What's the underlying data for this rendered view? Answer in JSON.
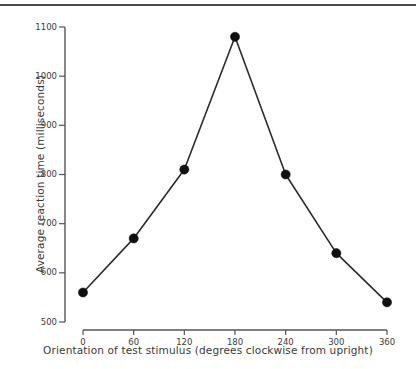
{
  "figure": {
    "kind": "line-plot",
    "background_color": "#ffffff",
    "top_rule_color": "#4a4a4a",
    "line_color": "#2b2b2b",
    "marker_color": "#101010",
    "axis_color": "#555555",
    "text_color": "#3a3a3a"
  },
  "chart_data": {
    "type": "line",
    "title": "",
    "xlabel": "Orientation of test stimulus (degrees clockwise from upright)",
    "ylabel": "Average reaction time (milliseconds)",
    "x": [
      0,
      60,
      120,
      180,
      240,
      300,
      360
    ],
    "values": [
      560,
      670,
      810,
      1080,
      800,
      640,
      540
    ],
    "series": [
      {
        "name": "Average reaction time",
        "values": [
          560,
          670,
          810,
          1080,
          800,
          640,
          540
        ]
      }
    ],
    "xlim": [
      0,
      360
    ],
    "ylim": [
      500,
      1100
    ],
    "xticks": [
      0,
      60,
      120,
      180,
      240,
      300,
      360
    ],
    "yticks": [
      500,
      600,
      700,
      800,
      900,
      1000,
      1100
    ],
    "xtick_labels": [
      "0",
      "60",
      "120",
      "180",
      "240",
      "300",
      "360"
    ],
    "ytick_labels": [
      "500",
      "600",
      "700",
      "800",
      "900",
      "1000",
      "1100"
    ],
    "grid": false,
    "legend": null,
    "legend_position": "none",
    "marker": "filled-circle",
    "annotations": []
  }
}
